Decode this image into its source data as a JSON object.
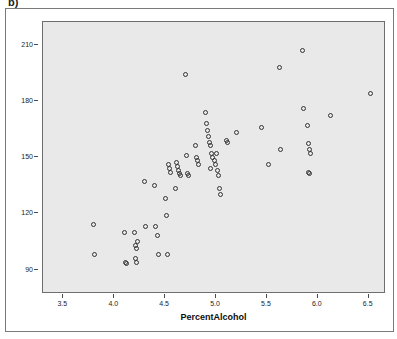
{
  "figure": {
    "label": "b)"
  },
  "chart_data": {
    "type": "scatter",
    "title": "",
    "xlabel": "PercentAlcohol",
    "ylabel": "Calories",
    "xlim": [
      3.3,
      6.65
    ],
    "ylim": [
      78,
      222
    ],
    "xticks": [
      "3.5",
      "4.0",
      "4.5",
      "5.0",
      "5.5",
      "6.0",
      "6.5"
    ],
    "xtick_values": [
      3.5,
      4.0,
      4.5,
      5.0,
      5.5,
      6.0,
      6.5
    ],
    "yticks": [
      "90",
      "120",
      "150",
      "180",
      "210"
    ],
    "ytick_values": [
      90,
      120,
      150,
      180,
      210
    ],
    "grid": false,
    "legend": null,
    "marker": "open-circle",
    "marker_color": "#333333",
    "panel_color": "#e9e9e9",
    "points": [
      [
        3.8,
        114
      ],
      [
        3.81,
        98
      ],
      [
        4.1,
        110
      ],
      [
        4.11,
        94
      ],
      [
        4.12,
        93
      ],
      [
        4.2,
        110
      ],
      [
        4.21,
        103
      ],
      [
        4.22,
        101
      ],
      [
        4.23,
        105
      ],
      [
        4.21,
        96
      ],
      [
        4.22,
        94
      ],
      [
        4.3,
        137
      ],
      [
        4.31,
        113
      ],
      [
        4.4,
        135
      ],
      [
        4.41,
        113
      ],
      [
        4.42,
        108
      ],
      [
        4.43,
        98
      ],
      [
        4.5,
        128
      ],
      [
        4.51,
        119
      ],
      [
        4.52,
        98
      ],
      [
        4.53,
        146
      ],
      [
        4.54,
        144
      ],
      [
        4.55,
        142
      ],
      [
        4.6,
        133
      ],
      [
        4.61,
        147
      ],
      [
        4.62,
        145
      ],
      [
        4.63,
        143
      ],
      [
        4.64,
        141
      ],
      [
        4.65,
        140
      ],
      [
        4.7,
        194
      ],
      [
        4.71,
        151
      ],
      [
        4.72,
        141
      ],
      [
        4.73,
        140
      ],
      [
        4.8,
        156
      ],
      [
        4.81,
        150
      ],
      [
        4.82,
        148
      ],
      [
        4.83,
        146
      ],
      [
        4.9,
        174
      ],
      [
        4.91,
        168
      ],
      [
        4.92,
        164
      ],
      [
        4.93,
        161
      ],
      [
        4.94,
        158
      ],
      [
        4.95,
        156
      ],
      [
        4.96,
        152
      ],
      [
        4.97,
        150
      ],
      [
        4.98,
        148
      ],
      [
        4.99,
        146
      ],
      [
        4.95,
        144
      ],
      [
        5.0,
        152
      ],
      [
        5.01,
        143
      ],
      [
        5.02,
        140
      ],
      [
        5.03,
        133
      ],
      [
        5.04,
        130
      ],
      [
        5.1,
        159
      ],
      [
        5.11,
        158
      ],
      [
        5.2,
        163
      ],
      [
        5.45,
        166
      ],
      [
        5.52,
        146
      ],
      [
        5.62,
        198
      ],
      [
        5.63,
        154
      ],
      [
        5.85,
        207
      ],
      [
        5.86,
        176
      ],
      [
        5.9,
        167
      ],
      [
        5.91,
        157
      ],
      [
        5.92,
        154
      ],
      [
        5.93,
        152
      ],
      [
        5.91,
        142
      ],
      [
        5.92,
        141
      ],
      [
        6.12,
        172
      ],
      [
        6.52,
        184
      ]
    ]
  }
}
